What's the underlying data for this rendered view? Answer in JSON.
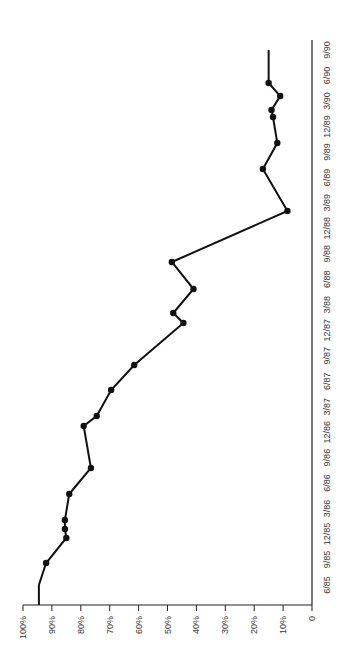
{
  "chart_data": {
    "type": "line",
    "orientation": "rotated 90° (time runs bottom-to-top, value axis horizontal)",
    "title": "",
    "xlabel": "",
    "ylabel": "",
    "ylim": [
      0,
      100
    ],
    "yticks": [
      "0",
      "10%",
      "20%",
      "30%",
      "40%",
      "50%",
      "60%",
      "70%",
      "80%",
      "90%",
      "100%"
    ],
    "xticks": [
      "6/85",
      "9/85",
      "12/85",
      "3/86",
      "6/86",
      "9/86",
      "12/86",
      "3/87",
      "6/87",
      "9/87",
      "12/87",
      "3/88",
      "6/88",
      "9/88",
      "12/88",
      "3/89",
      "6/89",
      "9/89",
      "12/89",
      "3/90",
      "6/90",
      "9/90"
    ],
    "grid": false,
    "series": [
      {
        "name": "series",
        "points": [
          {
            "y_px": 585,
            "v": 94.5
          },
          {
            "y_px": 563,
            "v": 92
          },
          {
            "y_px": 538,
            "v": 85
          },
          {
            "y_px": 529,
            "v": 85.5
          },
          {
            "y_px": 520,
            "v": 85.5
          },
          {
            "y_px": 494,
            "v": 84
          },
          {
            "y_px": 468,
            "v": 76.5
          },
          {
            "y_px": 426,
            "v": 79
          },
          {
            "y_px": 416,
            "v": 74.5
          },
          {
            "y_px": 390,
            "v": 69.5
          },
          {
            "y_px": 365,
            "v": 61.5
          },
          {
            "y_px": 323,
            "v": 44.5
          },
          {
            "y_px": 313,
            "v": 48
          },
          {
            "y_px": 289,
            "v": 41
          },
          {
            "y_px": 262,
            "v": 48.5
          },
          {
            "y_px": 211,
            "v": 8.5
          },
          {
            "y_px": 169,
            "v": 17
          },
          {
            "y_px": 143,
            "v": 12
          },
          {
            "y_px": 117,
            "v": 13.5
          },
          {
            "y_px": 110,
            "v": 14
          },
          {
            "y_px": 96,
            "v": 11
          },
          {
            "y_px": 83,
            "v": 15
          },
          {
            "y_px": 50,
            "v": 15
          }
        ]
      }
    ]
  }
}
